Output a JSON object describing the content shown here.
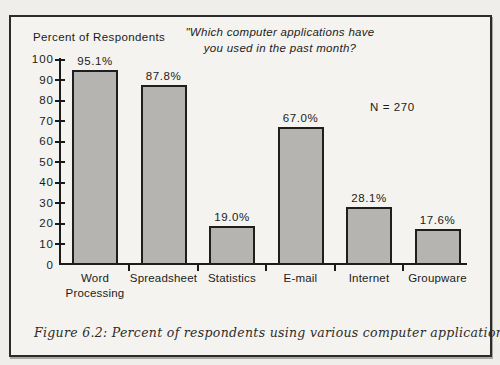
{
  "figure": {
    "caption": "Figure 6.2: Percent of respondents using various computer applications."
  },
  "chart_data": {
    "type": "bar",
    "title": "\"Which computer applications have you used in the past month?",
    "title_lines": [
      "\"Which computer applications have",
      "you used in the past month?"
    ],
    "y_axis_label": "Percent of Respondents",
    "sample_note": "N = 270",
    "categories": [
      "Word Processing",
      "Spreadsheet",
      "Statistics",
      "E-mail",
      "Internet",
      "Groupware"
    ],
    "category_lines": [
      [
        "Word",
        "Processing"
      ],
      [
        "Spreadsheet"
      ],
      [
        "Statistics"
      ],
      [
        "E-mail"
      ],
      [
        "Internet"
      ],
      [
        "Groupware"
      ]
    ],
    "values": [
      95.1,
      87.8,
      19.0,
      67.0,
      28.1,
      17.6
    ],
    "value_labels": [
      "95.1%",
      "87.8%",
      "19.0%",
      "67.0%",
      "28.1%",
      "17.6%"
    ],
    "xlabel": "",
    "ylabel": "Percent of Respondents",
    "ylim": [
      0,
      100
    ],
    "ytick_step": 10,
    "yticks": [
      0,
      10,
      20,
      30,
      40,
      50,
      60,
      70,
      80,
      90,
      100
    ],
    "grid": false,
    "legend": "none",
    "bar_color": "#b5b4b1",
    "bar_border_color": "#1e1e1e",
    "axis_color": "#1b1b1b",
    "frame_border_color": "#2b2b2b",
    "background_color": "#f4f3ef"
  }
}
